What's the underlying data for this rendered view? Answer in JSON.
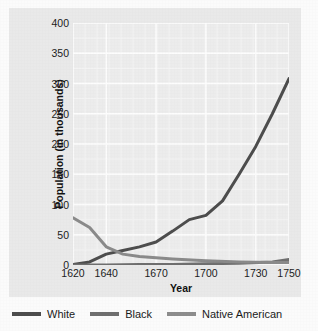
{
  "chart_data": {
    "type": "line",
    "title": "",
    "xlabel": "Year",
    "ylabel": "Population (in thousands)",
    "xlim": [
      1620,
      1750
    ],
    "ylim": [
      0,
      400
    ],
    "xticks": [
      1620,
      1640,
      1670,
      1700,
      1730,
      1750
    ],
    "xtick_labels": [
      "1620",
      "1640",
      "1670",
      "1700",
      "1730",
      "1750"
    ],
    "yticks": [
      0,
      50,
      100,
      150,
      200,
      250,
      300,
      350,
      400
    ],
    "ytick_labels": [
      "0",
      "50",
      "100",
      "150",
      "200",
      "250",
      "300",
      "350",
      "400"
    ],
    "grid": true,
    "legend_position": "bottom",
    "series": [
      {
        "name": "White",
        "color": "#4d4d4d",
        "x": [
          1620,
          1630,
          1640,
          1650,
          1660,
          1670,
          1680,
          1690,
          1700,
          1710,
          1720,
          1730,
          1740,
          1750
        ],
        "values": [
          1,
          5,
          18,
          24,
          30,
          38,
          56,
          75,
          82,
          106,
          150,
          196,
          250,
          308
        ]
      },
      {
        "name": "Black",
        "color": "#6f6f6f",
        "x": [
          1620,
          1640,
          1660,
          1680,
          1700,
          1720,
          1740,
          1750
        ],
        "values": [
          0,
          0,
          1,
          1,
          2,
          3,
          5,
          9
        ]
      },
      {
        "name": "Native American",
        "color": "#8a8a8a",
        "x": [
          1620,
          1630,
          1640,
          1650,
          1660,
          1670,
          1680,
          1700,
          1720,
          1740,
          1750
        ],
        "values": [
          78,
          62,
          30,
          18,
          14,
          12,
          10,
          7,
          5,
          4,
          4
        ]
      }
    ]
  },
  "legend": {
    "items": [
      {
        "label": "White",
        "color": "#4d4d4d"
      },
      {
        "label": "Black",
        "color": "#6f6f6f"
      },
      {
        "label": "Native American",
        "color": "#8d8d8d"
      }
    ]
  },
  "axes": {
    "x_title": "Year",
    "y_title": "Population (in thousands)"
  }
}
